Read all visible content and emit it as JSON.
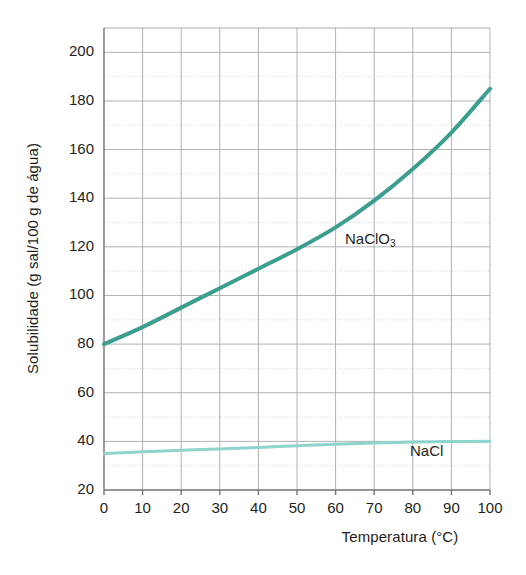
{
  "chart_data": {
    "type": "line",
    "title": "",
    "xlabel": "Temperatura (°C)",
    "ylabel": "Solubilidade (g sal/100 g de água)",
    "xlim": [
      0,
      100
    ],
    "ylim": [
      20,
      210
    ],
    "xticks": [
      0,
      10,
      20,
      30,
      40,
      50,
      60,
      70,
      80,
      90,
      100
    ],
    "xtick_labels": [
      "0",
      "10",
      "20",
      "30",
      "40",
      "50",
      "60",
      "70",
      "80",
      "90",
      "100"
    ],
    "yticks": [
      20,
      40,
      60,
      80,
      100,
      120,
      140,
      160,
      180,
      200
    ],
    "ytick_labels": [
      "20",
      "40",
      "60",
      "80",
      "100",
      "120",
      "140",
      "160",
      "180",
      "200"
    ],
    "y_minor_step": 10,
    "grid": true,
    "grid_color": "#b9bcc0",
    "legend": "inline-annotations",
    "series": [
      {
        "name": "NaClO3",
        "label_text": "NaClO",
        "label_sub": "3",
        "color": "#3d9e8f",
        "linewidth": 4,
        "x": [
          0,
          10,
          20,
          30,
          40,
          50,
          60,
          70,
          80,
          90,
          100
        ],
        "values": [
          80,
          87,
          95,
          103,
          111,
          119,
          128,
          139,
          152,
          167,
          185
        ]
      },
      {
        "name": "NaCl",
        "label_text": "NaCl",
        "label_sub": "",
        "color": "#8ed3cc",
        "linewidth": 3,
        "x": [
          0,
          10,
          20,
          30,
          40,
          50,
          60,
          70,
          80,
          90,
          100
        ],
        "values": [
          35.0,
          35.7,
          36.3,
          36.9,
          37.5,
          38.2,
          38.8,
          39.3,
          39.7,
          39.9,
          40.0
        ]
      }
    ]
  },
  "figure": {
    "background": "#ffffff",
    "axis_color": "#8c9094"
  }
}
